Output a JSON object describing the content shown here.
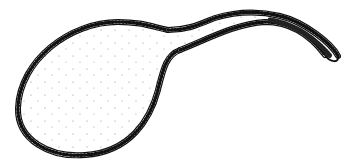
{
  "figure": {
    "title": "Flask-shaped outline drawing",
    "colors": {
      "background": "#ffffff",
      "stroke": "#111111",
      "hatch_fill": "#ffffff",
      "stipple": "#888888"
    }
  }
}
